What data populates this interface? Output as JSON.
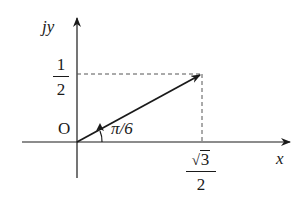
{
  "diagram": {
    "type": "phasor-diagram",
    "axes": {
      "x_label": "x",
      "y_label": "jy",
      "origin_label": "O"
    },
    "vector": {
      "angle_label": "π/6",
      "angle_rad": 0.5236,
      "x_component": {
        "radicand": "3",
        "denominator": "2",
        "value": 0.866
      },
      "y_component": {
        "numerator": "1",
        "denominator": "2",
        "value": 0.5
      }
    },
    "colors": {
      "line": "#1a1a1a",
      "dashed": "#555555",
      "background": "#ffffff"
    }
  }
}
